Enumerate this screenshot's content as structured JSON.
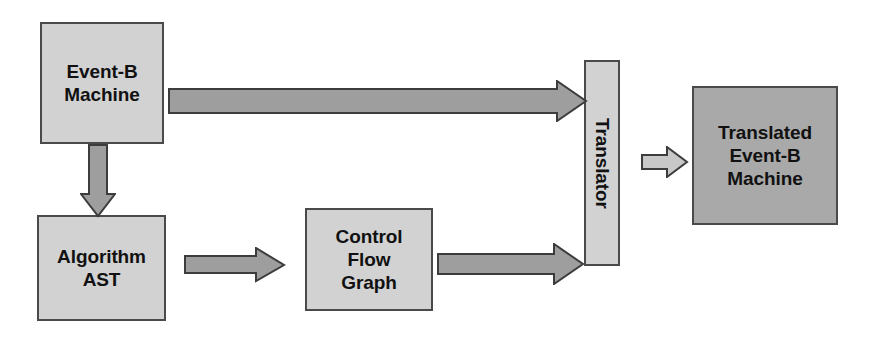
{
  "diagram": {
    "palette": {
      "box_fill_light": "#d2d2d2",
      "box_fill_dark": "#a9a9a9",
      "box_border": "#4a4a4a",
      "arrow_fill": "#9e9e9e",
      "arrow_stroke": "#3c3c3c",
      "background": "#ffffff",
      "text": "#111111"
    },
    "nodes": [
      {
        "id": "event-b-machine",
        "label": "Event-B\nMachine",
        "shade": "light",
        "rotated": false
      },
      {
        "id": "algorithm-ast",
        "label": "Algorithm\nAST",
        "shade": "light",
        "rotated": false
      },
      {
        "id": "control-flow-graph",
        "label": "Control\nFlow\nGraph",
        "shade": "light",
        "rotated": false
      },
      {
        "id": "translator",
        "label": "Translator",
        "shade": "light",
        "rotated": true
      },
      {
        "id": "translated-event-b-machine",
        "label": "Translated\nEvent-B\nMachine",
        "shade": "dark",
        "rotated": false
      }
    ],
    "edges": [
      {
        "id": "machine-to-translator",
        "from": "event-b-machine",
        "to": "translator",
        "direction": "right",
        "label": ""
      },
      {
        "id": "machine-to-ast",
        "from": "event-b-machine",
        "to": "algorithm-ast",
        "direction": "down",
        "label": ""
      },
      {
        "id": "ast-to-cfg",
        "from": "algorithm-ast",
        "to": "control-flow-graph",
        "direction": "right",
        "label": ""
      },
      {
        "id": "cfg-to-translator",
        "from": "control-flow-graph",
        "to": "translator",
        "direction": "right",
        "label": ""
      },
      {
        "id": "translator-to-output",
        "from": "translator",
        "to": "translated-event-b-machine",
        "direction": "right",
        "label": ""
      }
    ]
  }
}
